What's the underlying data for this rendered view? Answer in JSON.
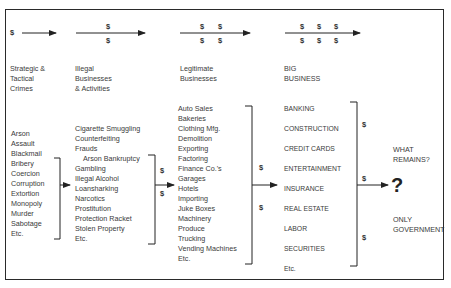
{
  "stages": [
    {
      "title": "Strategic &\nTactical\nCrimes",
      "title_lines": [
        "Strategic &",
        "Tactical",
        "Crimes"
      ],
      "dollars": 1
    },
    {
      "title_lines": [
        "Illegal",
        "Businesses",
        "& Activities"
      ],
      "dollars": 2
    },
    {
      "title_lines": [
        "Legitimate",
        "Businesses"
      ],
      "dollars": 4
    },
    {
      "title_lines": [
        "BIG",
        "BUSINESS"
      ],
      "dollars": 6
    }
  ],
  "lists": {
    "crimes": [
      "Arson",
      "Assault",
      "Blackmail",
      "Bribery",
      "Coercion",
      "Corruption",
      "Extortion",
      "Monopoly",
      "Murder",
      "Sabotage",
      "Etc."
    ],
    "illegal": [
      "Cigarette Smuggling",
      "Counterfeiting",
      "Frauds",
      "  Arson Bankruptcy",
      "Gambling",
      "Illegal Alcohol",
      "Loansharking",
      "Narcotics",
      "Prostitution",
      "Protection Racket",
      "Stolen Property",
      "Etc."
    ],
    "legitimate": [
      "Auto Sales",
      "Bakeries",
      "Clothing Mfg.",
      "Demolition",
      "Exporting",
      "Factoring",
      "Finance Co.'s",
      "Garages",
      "Hotels",
      "Importing",
      "Juke Boxes",
      "Machinery",
      "Produce",
      "Trucking",
      "Vending Machines",
      "Etc."
    ],
    "big_business": [
      "BANKING",
      "CONSTRUCTION",
      "CREDIT CARDS",
      "ENTERTAINMENT",
      "INSURANCE",
      "REAL ESTATE",
      "LABOR",
      "SECURITIES",
      "Etc."
    ]
  },
  "symbols": {
    "dollar": "$",
    "question": "?"
  },
  "outcome": {
    "top_lines": [
      "WHAT",
      "REMAINS?"
    ],
    "bottom_lines": [
      "ONLY",
      "GOVERNMENT"
    ]
  }
}
